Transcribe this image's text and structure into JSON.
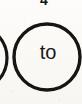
{
  "document": {
    "type": "scanned-diagram-fragment",
    "background_color": "#fbfaf7",
    "ink_color": "#161514"
  },
  "annotations": {
    "step_number": "4"
  },
  "nodes": [
    {
      "id": "node-to",
      "label": "to",
      "shape": "circle",
      "center_x": 47,
      "center_y": 57,
      "radius": 33,
      "stroke_width": 3,
      "clipped": "bottom"
    },
    {
      "id": "node-partial-left",
      "label": "",
      "shape": "circle",
      "center_x": -26,
      "center_y": 58,
      "radius": 33,
      "stroke_width": 3,
      "clipped": "left-offscreen"
    }
  ]
}
